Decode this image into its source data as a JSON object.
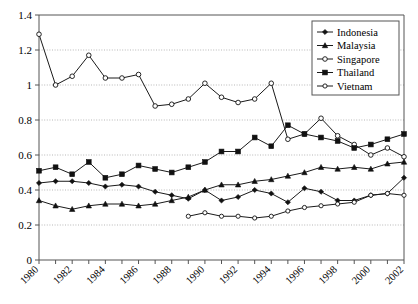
{
  "chart_data": {
    "type": "line",
    "title": "",
    "subtitle": "",
    "xlabel": "",
    "ylabel": "",
    "xlim": [
      1980,
      2002
    ],
    "ylim": [
      0,
      1.4
    ],
    "ytick_labels": [
      "0",
      "0.2",
      "0.4",
      "0.6",
      "0.8",
      "1",
      "1.2",
      "1.4"
    ],
    "ytick_values": [
      0,
      0.2,
      0.4,
      0.6,
      0.8,
      1.0,
      1.2,
      1.4
    ],
    "xtick_labels": [
      "1980",
      "1982",
      "1984",
      "1986",
      "1988",
      "1990",
      "1992",
      "1994",
      "1996",
      "1998",
      "2000",
      "2002"
    ],
    "xtick_values": [
      1980,
      1982,
      1984,
      1986,
      1988,
      1990,
      1992,
      1994,
      1996,
      1998,
      2000,
      2002
    ],
    "x": [
      1980,
      1981,
      1982,
      1983,
      1984,
      1985,
      1986,
      1987,
      1988,
      1989,
      1990,
      1991,
      1992,
      1993,
      1994,
      1995,
      1996,
      1997,
      1998,
      1999,
      2000,
      2001,
      2002
    ],
    "grid": {
      "horizontal": true,
      "vertical": false
    },
    "legend_position": "top-right",
    "series": [
      {
        "name": "Indonesia",
        "marker": "filled-diamond",
        "x": [
          1980,
          1981,
          1982,
          1983,
          1984,
          1985,
          1986,
          1987,
          1988,
          1989,
          1990,
          1991,
          1992,
          1993,
          1994,
          1995,
          1996,
          1997,
          1998,
          1999,
          2000,
          2001,
          2002
        ],
        "values": [
          0.44,
          0.45,
          0.45,
          0.44,
          0.42,
          0.43,
          0.42,
          0.39,
          0.37,
          0.35,
          0.4,
          0.34,
          0.36,
          0.4,
          0.38,
          0.33,
          0.41,
          0.39,
          0.34,
          0.34,
          0.37,
          0.38,
          0.47
        ]
      },
      {
        "name": "Malaysia",
        "marker": "filled-triangle",
        "x": [
          1980,
          1981,
          1982,
          1983,
          1984,
          1985,
          1986,
          1987,
          1988,
          1989,
          1990,
          1991,
          1992,
          1993,
          1994,
          1995,
          1996,
          1997,
          1998,
          1999,
          2000,
          2001,
          2002
        ],
        "values": [
          0.34,
          0.31,
          0.29,
          0.31,
          0.32,
          0.32,
          0.31,
          0.32,
          0.34,
          0.36,
          0.4,
          0.43,
          0.43,
          0.45,
          0.46,
          0.48,
          0.5,
          0.53,
          0.52,
          0.53,
          0.52,
          0.55,
          0.56
        ]
      },
      {
        "name": "Singapore",
        "marker": "open-circle",
        "x": [
          1980,
          1981,
          1982,
          1983,
          1984,
          1985,
          1986,
          1987,
          1988,
          1989,
          1990,
          1991,
          1992,
          1993,
          1994,
          1995,
          1996,
          1997,
          1998,
          1999,
          2000,
          2001,
          2002
        ],
        "values": [
          1.29,
          1.0,
          1.05,
          1.17,
          1.04,
          1.04,
          1.06,
          0.88,
          0.89,
          0.92,
          1.01,
          0.93,
          0.9,
          0.92,
          1.01,
          0.69,
          0.72,
          0.81,
          0.71,
          0.66,
          0.6,
          0.64,
          0.59
        ]
      },
      {
        "name": "Thailand",
        "marker": "filled-square",
        "x": [
          1980,
          1981,
          1982,
          1983,
          1984,
          1985,
          1986,
          1987,
          1988,
          1989,
          1990,
          1991,
          1992,
          1993,
          1994,
          1995,
          1996,
          1997,
          1998,
          1999,
          2000,
          2001,
          2002
        ],
        "values": [
          0.51,
          0.53,
          0.49,
          0.56,
          0.47,
          0.49,
          0.54,
          0.52,
          0.5,
          0.53,
          0.56,
          0.62,
          0.62,
          0.7,
          0.65,
          0.77,
          0.72,
          0.7,
          0.68,
          0.64,
          0.66,
          0.69,
          0.72
        ]
      },
      {
        "name": "Vietnam",
        "marker": "open-circle-small",
        "x": [
          1989,
          1990,
          1991,
          1992,
          1993,
          1994,
          1995,
          1996,
          1997,
          1998,
          1999,
          2000,
          2001,
          2002
        ],
        "values": [
          0.25,
          0.27,
          0.25,
          0.25,
          0.24,
          0.25,
          0.28,
          0.3,
          0.31,
          0.32,
          0.33,
          0.37,
          0.38,
          0.37
        ]
      }
    ]
  },
  "legend": {
    "items": [
      {
        "label": "Indonesia"
      },
      {
        "label": "Malaysia"
      },
      {
        "label": "Singapore"
      },
      {
        "label": "Thailand"
      },
      {
        "label": "Vietnam"
      }
    ]
  }
}
